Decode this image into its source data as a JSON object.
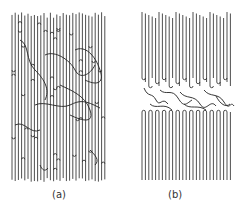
{
  "figure": {
    "panels": [
      {
        "id": "a",
        "label": "(a)",
        "description": "Chain-folded lamellae with random re-entry and loose interconnecting loops spread throughout"
      },
      {
        "id": "b",
        "label": "(b)",
        "description": "Two lamellar stacks with regular adjacent folds; entangled loops confined to the interlamellar amorphous layer"
      }
    ],
    "line_color": "#222222",
    "background_color": "#ffffff"
  }
}
